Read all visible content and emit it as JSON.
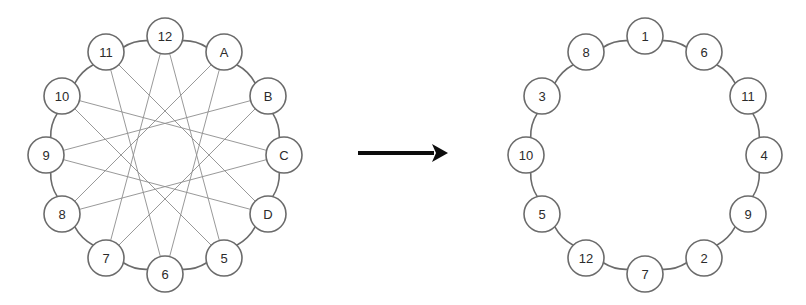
{
  "figure": {
    "title": "",
    "background_color": "#ffffff",
    "node_fill": "#ffffff",
    "node_stroke": "#6b6b6b",
    "label_color": "#2b2b2b",
    "ring_edge_color": "#6b6b6b",
    "chord_edge_color": "#8d8d8d",
    "arrow_color": "#0d0d0d"
  },
  "left_graph": {
    "name": "source-ring-with-chords",
    "center_x": 165,
    "center_y": 155,
    "radius": 119,
    "node_radius": 18,
    "start_angle_deg": -90,
    "direction": "clockwise",
    "chord_skip": 5,
    "labels": [
      "12",
      "A",
      "B",
      "C",
      "D",
      "5",
      "6",
      "7",
      "8",
      "9",
      "10",
      "11"
    ],
    "nodes": [
      {
        "index": 0,
        "label": "12",
        "x": 165,
        "y": 36
      },
      {
        "index": 1,
        "label": "A",
        "x": 224,
        "y": 52
      },
      {
        "index": 2,
        "label": "B",
        "x": 268,
        "y": 96
      },
      {
        "index": 3,
        "label": "C",
        "x": 284,
        "y": 155
      },
      {
        "index": 4,
        "label": "D",
        "x": 268,
        "y": 214
      },
      {
        "index": 5,
        "label": "5",
        "x": 224,
        "y": 258
      },
      {
        "index": 6,
        "label": "6",
        "x": 165,
        "y": 274
      },
      {
        "index": 7,
        "label": "7",
        "x": 106,
        "y": 258
      },
      {
        "index": 8,
        "label": "8",
        "x": 62,
        "y": 214
      },
      {
        "index": 9,
        "label": "9",
        "x": 46,
        "y": 155
      },
      {
        "index": 10,
        "label": "10",
        "x": 62,
        "y": 96
      },
      {
        "index": 11,
        "label": "11",
        "x": 106,
        "y": 52
      }
    ],
    "ring_edges": [
      [
        0,
        1
      ],
      [
        1,
        2
      ],
      [
        2,
        3
      ],
      [
        3,
        4
      ],
      [
        4,
        5
      ],
      [
        5,
        6
      ],
      [
        6,
        7
      ],
      [
        7,
        8
      ],
      [
        8,
        9
      ],
      [
        9,
        10
      ],
      [
        10,
        11
      ],
      [
        11,
        0
      ]
    ],
    "chord_edges": [
      [
        0,
        5
      ],
      [
        1,
        6
      ],
      [
        2,
        7
      ],
      [
        3,
        8
      ],
      [
        4,
        9
      ],
      [
        5,
        10
      ],
      [
        6,
        11
      ],
      [
        7,
        0
      ],
      [
        8,
        1
      ],
      [
        9,
        2
      ],
      [
        10,
        3
      ],
      [
        11,
        4
      ]
    ]
  },
  "arrow": {
    "name": "transformation-arrow",
    "x1": 358,
    "y1": 153,
    "x2": 448,
    "y2": 153,
    "head_length": 16,
    "head_half_width": 9
  },
  "right_graph": {
    "name": "result-ring",
    "center_x": 645,
    "center_y": 155,
    "radius": 119,
    "node_radius": 18,
    "start_angle_deg": -90,
    "direction": "clockwise",
    "labels": [
      "1",
      "6",
      "11",
      "4",
      "9",
      "2",
      "7",
      "12",
      "5",
      "10",
      "3",
      "8"
    ],
    "nodes": [
      {
        "index": 0,
        "label": "1",
        "x": 645,
        "y": 36
      },
      {
        "index": 1,
        "label": "6",
        "x": 704,
        "y": 52
      },
      {
        "index": 2,
        "label": "11",
        "x": 748,
        "y": 96
      },
      {
        "index": 3,
        "label": "4",
        "x": 764,
        "y": 155
      },
      {
        "index": 4,
        "label": "9",
        "x": 748,
        "y": 214
      },
      {
        "index": 5,
        "label": "2",
        "x": 704,
        "y": 258
      },
      {
        "index": 6,
        "label": "7",
        "x": 645,
        "y": 274
      },
      {
        "index": 7,
        "label": "12",
        "x": 586,
        "y": 258
      },
      {
        "index": 8,
        "label": "5",
        "x": 542,
        "y": 214
      },
      {
        "index": 9,
        "label": "10",
        "x": 526,
        "y": 155
      },
      {
        "index": 10,
        "label": "3",
        "x": 542,
        "y": 96
      },
      {
        "index": 11,
        "label": "8",
        "x": 586,
        "y": 52
      }
    ],
    "ring_edges": [
      [
        0,
        1
      ],
      [
        1,
        2
      ],
      [
        2,
        3
      ],
      [
        3,
        4
      ],
      [
        4,
        5
      ],
      [
        5,
        6
      ],
      [
        6,
        7
      ],
      [
        7,
        8
      ],
      [
        8,
        9
      ],
      [
        9,
        10
      ],
      [
        10,
        11
      ],
      [
        11,
        0
      ]
    ],
    "chord_edges": []
  }
}
